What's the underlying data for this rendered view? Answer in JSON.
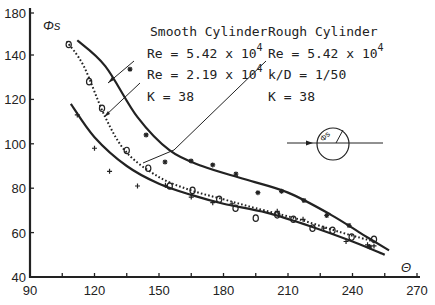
{
  "chart_data": {
    "type": "scatter",
    "title": "",
    "xlabel": "Θ",
    "ylabel": "Φs",
    "xlim": [
      90,
      270
    ],
    "ylim": [
      40,
      180
    ],
    "x_ticks": [
      90,
      120,
      150,
      180,
      210,
      240,
      270
    ],
    "y_ticks": [
      40,
      60,
      80,
      100,
      120,
      140,
      180
    ],
    "grid": false,
    "legend_position": "top-right annotations with leader lines",
    "annotations": {
      "smooth": {
        "heading": "Smooth Cylinder",
        "re1": "Re = 5.42 x 10",
        "re1_exp": "4",
        "re2": "Re = 2.19 x 10",
        "re2_exp": "4",
        "k": "K = 38"
      },
      "rough": {
        "heading": "Rough Cylinder",
        "re": "Re = 5.42 x 10",
        "re_exp": "4",
        "kd": "k/D = 1/50",
        "k": "K = 38"
      },
      "inset": {
        "label": "Φs",
        "description": "cylinder with flow arrow and angle Φs"
      }
    },
    "series": [
      {
        "name": "Smooth Cylinder, Re = 5.42 x 10^4",
        "marker": "asterisk",
        "line": "solid",
        "x": [
          136.5,
          144,
          152.8,
          164.9,
          175,
          185.8,
          196,
          207,
          217.4,
          228,
          238.4,
          248
        ],
        "y": [
          133.6,
          104,
          91.8,
          92.3,
          90.5,
          86.4,
          78,
          78.6,
          74.5,
          67.7,
          63.2,
          53.6
        ]
      },
      {
        "name": "Smooth Cylinder, Re = 2.19 x 10^4",
        "marker": "circle",
        "line": "dotted",
        "x": [
          108,
          117.5,
          123.5,
          135,
          145,
          155,
          165.6,
          178,
          185.6,
          195,
          205,
          212.5,
          221.4,
          230.7,
          239.6,
          250
        ],
        "y": [
          150,
          128,
          116,
          97,
          89,
          81,
          79,
          75,
          71,
          66.5,
          68,
          66,
          62,
          61,
          58,
          57
        ]
      },
      {
        "name": "Rough Cylinder, Re = 5.42 x 10^4",
        "marker": "plus",
        "line": "solid",
        "x": [
          112,
          120,
          127,
          140,
          153,
          165,
          175,
          184,
          205,
          217,
          226.6,
          237,
          247,
          250
        ],
        "y": [
          113,
          98,
          87.6,
          81,
          81.3,
          76,
          73.5,
          73,
          69.6,
          66,
          62,
          56,
          54.5,
          54
        ]
      }
    ],
    "fit_curves": {
      "smooth_high_re": [
        [
          112,
          154
        ],
        [
          125,
          135
        ],
        [
          140,
          112
        ],
        [
          155,
          97
        ],
        [
          170,
          90
        ],
        [
          190,
          84
        ],
        [
          210,
          78
        ],
        [
          230,
          68
        ],
        [
          245,
          59
        ],
        [
          257,
          52
        ]
      ],
      "smooth_low_re": [
        [
          107,
          153
        ],
        [
          115,
          135
        ],
        [
          125,
          112
        ],
        [
          135,
          96
        ],
        [
          150,
          85
        ],
        [
          165,
          79
        ],
        [
          180,
          75
        ],
        [
          195,
          71
        ],
        [
          215,
          66
        ],
        [
          235,
          60
        ],
        [
          250,
          56
        ]
      ],
      "rough": [
        [
          109,
          118
        ],
        [
          120,
          103
        ],
        [
          135,
          90
        ],
        [
          150,
          82
        ],
        [
          165,
          77
        ],
        [
          180,
          73
        ],
        [
          200,
          69
        ],
        [
          220,
          63
        ],
        [
          240,
          56
        ],
        [
          255,
          50
        ]
      ]
    }
  }
}
